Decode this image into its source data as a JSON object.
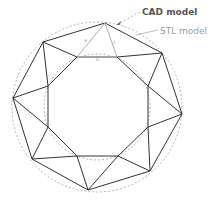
{
  "labels": {
    "cad": "CAD model",
    "stl": "STL model",
    "side_a": "a",
    "side_b": "b",
    "side_c": "c"
  },
  "colors": {
    "mesh_edges": "#333333",
    "dashed_circles": "#999999",
    "triangle_highlight": "#aaaaaa",
    "cad_label": "#555555",
    "stl_label": "#999999"
  }
}
